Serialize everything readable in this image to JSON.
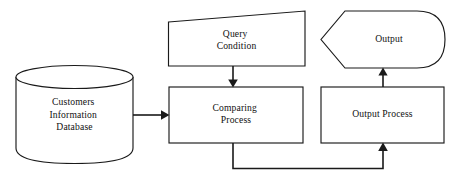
{
  "diagram": {
    "background_color": "#ffffff",
    "stroke_color": "#1a1a1a",
    "text_color": "#111111",
    "nodes": {
      "database": {
        "shape": "cylinder",
        "line1": "Customers",
        "line2": "Information",
        "line3": "Database"
      },
      "query_condition": {
        "shape": "trapezoid",
        "line1": "Query",
        "line2": "Condition"
      },
      "output": {
        "shape": "display",
        "line1": "Output"
      },
      "comparing_process": {
        "shape": "rectangle",
        "line1": "Comparing",
        "line2": "Process"
      },
      "output_process": {
        "shape": "rectangle",
        "line1": "Output Process"
      }
    },
    "edges": [
      {
        "id": "db-to-comparing",
        "from": "database",
        "to": "comparing_process",
        "direction": "right",
        "label": ""
      },
      {
        "id": "query-to-comparing",
        "from": "query_condition",
        "to": "comparing_process",
        "direction": "down",
        "label": ""
      },
      {
        "id": "comparing-to-output-process",
        "from": "comparing_process",
        "to": "output_process",
        "direction": "up",
        "label": ""
      },
      {
        "id": "output-process-to-output",
        "from": "output_process",
        "to": "output",
        "direction": "up",
        "label": ""
      }
    ]
  }
}
